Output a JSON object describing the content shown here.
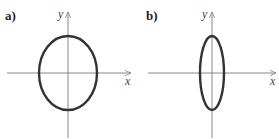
{
  "panels": [
    {
      "label": "a)",
      "x_axis_label": "x",
      "y_axis_label": "y",
      "shape": "ellipse",
      "center": [
        68,
        73
      ],
      "rx": 29,
      "ry": 37
    },
    {
      "label": "b)",
      "x_axis_label": "x",
      "y_axis_label": "y",
      "shape": "ellipse",
      "center": [
        212,
        73
      ],
      "rx": 12,
      "ry": 37
    }
  ],
  "colors": {
    "curve": "#333333",
    "axis": "#888888"
  }
}
